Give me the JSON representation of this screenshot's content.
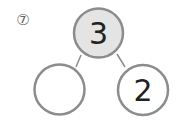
{
  "problem": {
    "number_label": "⑦"
  },
  "number_bond": {
    "whole": "3",
    "part_left": "",
    "part_right": "2"
  },
  "colors": {
    "stroke": "#8c8c8c",
    "whole_fill": "#e4e4e4",
    "part_fill": "#ffffff",
    "text": "#222222"
  }
}
